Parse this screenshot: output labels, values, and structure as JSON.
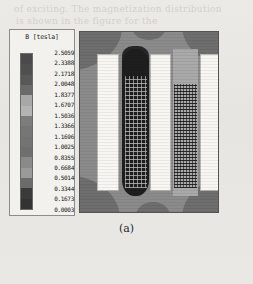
{
  "figure": {
    "caption": "(a)"
  },
  "legend": {
    "title": "B [tesla]",
    "units": "tesla",
    "quantity": "B",
    "tick_labels": [
      "2.5059",
      "2.3388",
      "2.1718",
      "2.0048",
      "1.8377",
      "1.6707",
      "1.5036",
      "1.3366",
      "1.1696",
      "1.0025",
      "0.8355",
      "0.6684",
      "0.5014",
      "0.3344",
      "0.1673",
      "0.0003"
    ],
    "band_colors": [
      "#4a4a4a",
      "#4f4f4f",
      "#585858",
      "#6a6a6a",
      "#a8a8a8",
      "#b4b4b4",
      "#7d7d7d",
      "#767676",
      "#737373",
      "#6f6f6f",
      "#8a8a8a",
      "#9a9a9a",
      "#6b6b6b",
      "#3a3a3a",
      "#333333"
    ]
  },
  "chart_data": {
    "type": "heatmap",
    "title": "B [tesla]",
    "xlabel": "",
    "ylabel": "",
    "colorbar_label": "B [tesla]",
    "colorbar_orientation": "vertical",
    "grid": false,
    "legend_position": "left",
    "levels": [
      0.0003,
      0.1673,
      0.3344,
      0.5014,
      0.6684,
      0.8355,
      1.0025,
      1.1696,
      1.3366,
      1.5036,
      1.6707,
      1.8377,
      2.0048,
      2.1718,
      2.3388,
      2.5059
    ],
    "zlim": [
      0.0003,
      2.5059
    ],
    "level_step": 0.167,
    "colormap": "grayscale",
    "regions": [
      {
        "name": "background-core",
        "value_range": [
          1.0,
          1.5
        ],
        "shade": "#8b8b8b"
      },
      {
        "name": "corner-lobes",
        "value_range": [
          1.5,
          1.85
        ],
        "shade": "#6e6e6e"
      },
      {
        "name": "left-coil-core",
        "value_range": [
          2.34,
          2.51
        ],
        "shade": "#1e1e1e"
      },
      {
        "name": "right-coil-core",
        "value_range": [
          0.5,
          0.84
        ],
        "shade": "#a9a9a9"
      },
      {
        "name": "air-slots",
        "value_range": [
          0.0003,
          0.1673
        ],
        "shade": "#f7f6f3"
      }
    ],
    "annotations": [
      "(a)"
    ]
  },
  "plot": {
    "slots": [
      {
        "name": "slot-1",
        "left_px": 17,
        "width_px": 22
      },
      {
        "name": "slot-2",
        "left_px": 70,
        "width_px": 21
      },
      {
        "name": "slot-3",
        "left_px": 120,
        "width_px": 21
      }
    ]
  },
  "background_text": {
    "line_top_1": "of exciting.  The magnetization distribution",
    "line_top_2": "is shown in the figure for the",
    "line_mid_1": "the same of the",
    "line_mid_2": "the flux density",
    "line_bot_1": "results indicate"
  }
}
